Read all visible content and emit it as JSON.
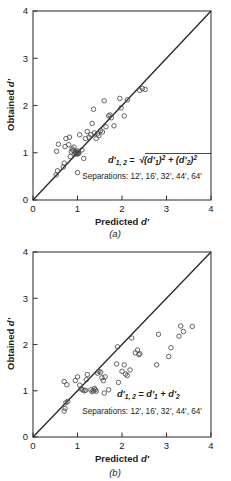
{
  "figure": {
    "panels": [
      {
        "id": "a",
        "label": "(a)",
        "formula": "d'1, 2 = √((d'1)² + (d'2)²)",
        "formula_parts": {
          "lhs": "d'",
          "lhs_sub": "1, 2",
          "equals": "=",
          "term1": "(d'",
          "term1_sub": "1",
          "term1_close": ")",
          "exp": "2",
          "plus": "+",
          "term2": "(d'",
          "term2_sub": "2",
          "term2_close": ")"
        },
        "separations_label": "Separations: 12′, 16′, 32′, 44′, 64′"
      },
      {
        "id": "b",
        "label": "(b)",
        "formula": "d'1, 2 = d'1 + d'2",
        "formula_parts": {
          "lhs": "d'",
          "lhs_sub": "1, 2",
          "equals": "=",
          "term1": "d'",
          "term1_sub": "1",
          "plus": "+",
          "term2": "d'",
          "term2_sub": "2"
        },
        "separations_label": "Separations: 12′, 16′, 32′, 44′, 64′"
      }
    ],
    "axis_title_x_pre": "Predicted ",
    "axis_title_x_it": "d′",
    "axis_title_y_pre": "Obtained ",
    "axis_title_y_it": "d′",
    "tick_labels_x": [
      "0",
      "1",
      "2",
      "3",
      "4"
    ],
    "tick_labels_y": [
      "0",
      "1",
      "2",
      "3",
      "4"
    ]
  },
  "chart_data": [
    {
      "type": "scatter",
      "panel": "a",
      "title": "",
      "xlabel": "Predicted d'",
      "ylabel": "Obtained d'",
      "xlim": [
        0,
        4
      ],
      "ylim": [
        0,
        4
      ],
      "xticks": [
        0,
        1,
        2,
        3,
        4
      ],
      "yticks": [
        0,
        1,
        2,
        3,
        4
      ],
      "grid": false,
      "legend": "none",
      "annotations": [
        "d'1, 2 = sqrt((d'1)^2 + (d'2)^2)",
        "Separations: 12', 16', 32', 44', 64'"
      ],
      "reference_line": {
        "type": "identity",
        "from": [
          0,
          0
        ],
        "to": [
          4,
          4
        ],
        "label": "y = x"
      },
      "marker": "open-circle",
      "points": [
        [
          0.52,
          0.53
        ],
        [
          0.55,
          0.62
        ],
        [
          0.53,
          1.03
        ],
        [
          0.57,
          1.18
        ],
        [
          0.68,
          0.7
        ],
        [
          0.7,
          0.78
        ],
        [
          0.72,
          1.13
        ],
        [
          0.74,
          1.3
        ],
        [
          0.8,
          1.17
        ],
        [
          0.82,
          1.33
        ],
        [
          0.84,
          0.92
        ],
        [
          0.86,
          1.02
        ],
        [
          0.88,
          1.08
        ],
        [
          0.9,
          1.05
        ],
        [
          0.92,
          1.12
        ],
        [
          0.94,
          0.98
        ],
        [
          0.96,
          1.0
        ],
        [
          0.97,
          1.02
        ],
        [
          0.98,
          0.97
        ],
        [
          0.99,
          1.0
        ],
        [
          1.0,
          1.04
        ],
        [
          1.01,
          0.98
        ],
        [
          1.02,
          1.01
        ],
        [
          1.03,
          0.99
        ],
        [
          1.0,
          0.58
        ],
        [
          1.05,
          1.38
        ],
        [
          1.1,
          1.06
        ],
        [
          1.14,
          0.88
        ],
        [
          1.18,
          1.3
        ],
        [
          1.22,
          1.45
        ],
        [
          1.26,
          1.33
        ],
        [
          1.3,
          1.38
        ],
        [
          1.33,
          1.62
        ],
        [
          1.36,
          1.92
        ],
        [
          1.38,
          1.42
        ],
        [
          1.42,
          1.3
        ],
        [
          1.45,
          1.4
        ],
        [
          1.48,
          1.36
        ],
        [
          1.52,
          1.47
        ],
        [
          1.56,
          1.44
        ],
        [
          1.6,
          2.1
        ],
        [
          1.64,
          1.55
        ],
        [
          1.7,
          1.78
        ],
        [
          1.73,
          1.8
        ],
        [
          1.76,
          1.74
        ],
        [
          1.82,
          1.57
        ],
        [
          1.95,
          2.15
        ],
        [
          1.98,
          1.95
        ],
        [
          2.05,
          1.78
        ],
        [
          2.12,
          2.12
        ],
        [
          2.4,
          2.32
        ],
        [
          2.46,
          2.36
        ],
        [
          2.52,
          2.34
        ]
      ]
    },
    {
      "type": "scatter",
      "panel": "b",
      "title": "",
      "xlabel": "Predicted d'",
      "ylabel": "Obtained d'",
      "xlim": [
        0,
        4
      ],
      "ylim": [
        0,
        4
      ],
      "xticks": [
        0,
        1,
        2,
        3,
        4
      ],
      "yticks": [
        0,
        1,
        2,
        3,
        4
      ],
      "grid": false,
      "legend": "none",
      "annotations": [
        "d'1, 2 = d'1 + d'2",
        "Separations: 12', 16', 32', 44', 64'"
      ],
      "reference_line": {
        "type": "identity",
        "from": [
          0,
          0
        ],
        "to": [
          4,
          4
        ],
        "label": "y = x"
      },
      "marker": "open-circle",
      "points": [
        [
          0.7,
          0.56
        ],
        [
          0.72,
          0.62
        ],
        [
          0.74,
          0.74
        ],
        [
          0.78,
          0.77
        ],
        [
          0.7,
          1.2
        ],
        [
          0.76,
          1.13
        ],
        [
          0.95,
          1.22
        ],
        [
          1.0,
          1.3
        ],
        [
          1.05,
          1.12
        ],
        [
          1.08,
          1.04
        ],
        [
          1.12,
          1.02
        ],
        [
          1.15,
          1.0
        ],
        [
          1.18,
          1.01
        ],
        [
          1.2,
          1.24
        ],
        [
          1.22,
          1.35
        ],
        [
          1.3,
          1.02
        ],
        [
          1.33,
          0.98
        ],
        [
          1.36,
          1.0
        ],
        [
          1.38,
          1.05
        ],
        [
          1.4,
          1.02
        ],
        [
          1.42,
          0.99
        ],
        [
          1.45,
          1.38
        ],
        [
          1.48,
          1.42
        ],
        [
          1.52,
          1.4
        ],
        [
          1.55,
          1.28
        ],
        [
          1.58,
          1.22
        ],
        [
          1.6,
          0.95
        ],
        [
          1.62,
          1.3
        ],
        [
          1.7,
          1.02
        ],
        [
          1.88,
          1.58
        ],
        [
          1.9,
          1.95
        ],
        [
          1.92,
          1.18
        ],
        [
          2.0,
          1.42
        ],
        [
          2.05,
          1.56
        ],
        [
          2.08,
          1.36
        ],
        [
          2.12,
          1.33
        ],
        [
          2.18,
          1.45
        ],
        [
          2.22,
          2.14
        ],
        [
          2.3,
          1.82
        ],
        [
          2.35,
          1.88
        ],
        [
          2.38,
          1.78
        ],
        [
          2.4,
          1.8
        ],
        [
          2.78,
          1.56
        ],
        [
          2.82,
          2.22
        ],
        [
          3.05,
          1.74
        ],
        [
          3.1,
          1.93
        ],
        [
          3.28,
          2.18
        ],
        [
          3.32,
          2.4
        ],
        [
          3.38,
          2.28
        ],
        [
          3.58,
          2.39
        ]
      ]
    }
  ]
}
